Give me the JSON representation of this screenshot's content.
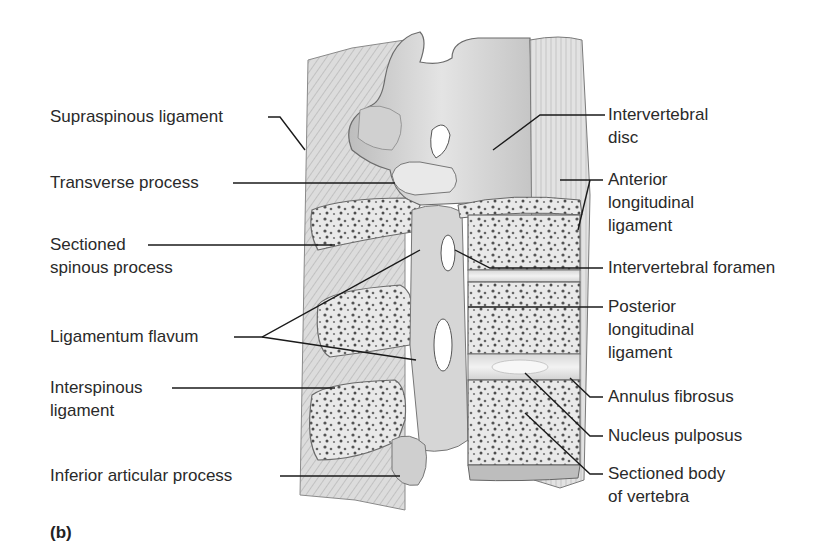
{
  "figure": {
    "panel_tag": "(b)"
  },
  "labels_left": [
    {
      "id": "supraspinous",
      "text": "Supraspinous ligament"
    },
    {
      "id": "transverse",
      "text": "Transverse process"
    },
    {
      "id": "sectioned_spinous_1",
      "text": "Sectioned"
    },
    {
      "id": "sectioned_spinous_2",
      "text": "spinous process"
    },
    {
      "id": "lig_flavum",
      "text": "Ligamentum flavum"
    },
    {
      "id": "interspinous_1",
      "text": "Interspinous"
    },
    {
      "id": "interspinous_2",
      "text": "ligament"
    },
    {
      "id": "inferior_articular",
      "text": "Inferior articular process"
    }
  ],
  "labels_right": [
    {
      "id": "iv_disc_1",
      "text": "Intervertebral"
    },
    {
      "id": "iv_disc_2",
      "text": "disc"
    },
    {
      "id": "anterior_1",
      "text": "Anterior"
    },
    {
      "id": "anterior_2",
      "text": "longitudinal"
    },
    {
      "id": "anterior_3",
      "text": "ligament"
    },
    {
      "id": "iv_foramen",
      "text": "Intervertebral foramen"
    },
    {
      "id": "posterior_1",
      "text": "Posterior"
    },
    {
      "id": "posterior_2",
      "text": "longitudinal"
    },
    {
      "id": "posterior_3",
      "text": "ligament"
    },
    {
      "id": "annulus",
      "text": "Annulus fibrosus"
    },
    {
      "id": "nucleus",
      "text": "Nucleus pulposus"
    },
    {
      "id": "body_1",
      "text": "Sectioned body"
    },
    {
      "id": "body_2",
      "text": "of vertebra"
    }
  ],
  "colors": {
    "bone_light": "#e6e6e6",
    "bone_mid": "#c9c9c9",
    "bone_dark": "#9a9a9a",
    "outline": "#6b6b6b",
    "leader": "#1a1a1a",
    "text": "#2a2a2a"
  }
}
